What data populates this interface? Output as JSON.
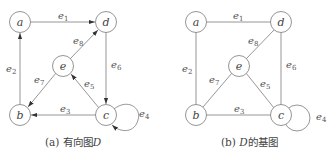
{
  "diagrams": [
    {
      "id": "a",
      "caption_prefix": "(a) 有向图",
      "caption_var": "D",
      "type": "directed",
      "nodes": [
        {
          "id": "a",
          "label": "a",
          "x": 20,
          "y": 22
        },
        {
          "id": "d",
          "label": "d",
          "x": 106,
          "y": 22
        },
        {
          "id": "b",
          "label": "b",
          "x": 20,
          "y": 115
        },
        {
          "id": "c",
          "label": "c",
          "x": 106,
          "y": 115
        },
        {
          "id": "e",
          "label": "e",
          "x": 63,
          "y": 66
        }
      ],
      "edges": [
        {
          "label": "e",
          "sub": "1",
          "from": "a",
          "to": "d"
        },
        {
          "label": "e",
          "sub": "2",
          "from": "b",
          "to": "a"
        },
        {
          "label": "e",
          "sub": "3",
          "from": "c",
          "to": "b"
        },
        {
          "label": "e",
          "sub": "4",
          "from": "c",
          "to": "c",
          "loop": true
        },
        {
          "label": "e",
          "sub": "5",
          "from": "c",
          "to": "e"
        },
        {
          "label": "e",
          "sub": "6",
          "from": "d",
          "to": "c"
        },
        {
          "label": "e",
          "sub": "7",
          "from": "e",
          "to": "b"
        },
        {
          "label": "e",
          "sub": "8",
          "from": "e",
          "to": "d"
        }
      ]
    },
    {
      "id": "b",
      "caption_prefix": "(b) ",
      "caption_var": "D",
      "caption_suffix": "的基图",
      "type": "undirected",
      "nodes": [
        {
          "id": "a",
          "label": "a",
          "x": 196,
          "y": 22
        },
        {
          "id": "d",
          "label": "d",
          "x": 281,
          "y": 22
        },
        {
          "id": "b",
          "label": "b",
          "x": 196,
          "y": 115
        },
        {
          "id": "c",
          "label": "c",
          "x": 281,
          "y": 115
        },
        {
          "id": "e",
          "label": "e",
          "x": 239,
          "y": 66
        }
      ],
      "edges": [
        {
          "label": "e",
          "sub": "1",
          "from": "a",
          "to": "d"
        },
        {
          "label": "e",
          "sub": "2",
          "from": "a",
          "to": "b"
        },
        {
          "label": "e",
          "sub": "3",
          "from": "b",
          "to": "c"
        },
        {
          "label": "e",
          "sub": "4",
          "from": "c",
          "to": "c",
          "loop": true
        },
        {
          "label": "e",
          "sub": "5",
          "from": "e",
          "to": "c"
        },
        {
          "label": "e",
          "sub": "6",
          "from": "d",
          "to": "c"
        },
        {
          "label": "e",
          "sub": "7",
          "from": "e",
          "to": "b"
        },
        {
          "label": "e",
          "sub": "8",
          "from": "e",
          "to": "d"
        }
      ]
    }
  ]
}
